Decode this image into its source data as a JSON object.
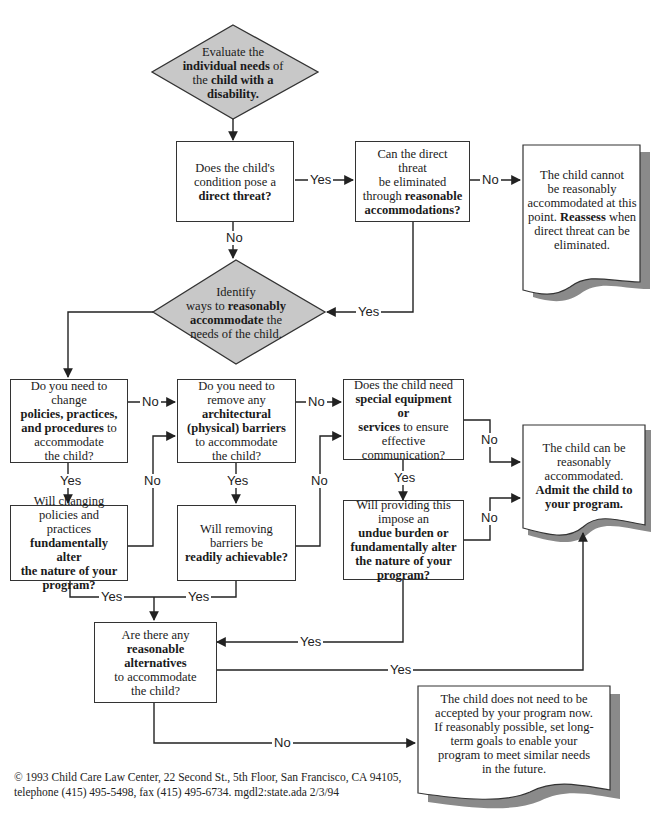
{
  "diagram": {
    "type": "flowchart",
    "colors": {
      "decision_fill": "#c8c8c8",
      "line": "#222222",
      "shadow": "#8a8a8a",
      "background": "#ffffff"
    }
  },
  "nodes": {
    "evaluate": {
      "shape": "diamond",
      "t1": "Evaluate the",
      "b1": "individual needs",
      "t2": " of",
      "t3": "the ",
      "b2": "child with a",
      "b3": "disability."
    },
    "direct_threat": {
      "shape": "box",
      "t1": "Does the child's",
      "t2": "condition pose a",
      "b1": "direct threat?"
    },
    "eliminate_threat": {
      "shape": "box",
      "t1": "Can the direct threat",
      "t2": "be eliminated",
      "t3": "through ",
      "b1": "reasonable",
      "b2": "accommodations?"
    },
    "cannot_accommodate": {
      "shape": "document",
      "t1": "The child cannot",
      "t2": "be reasonably",
      "t3": "accommodated at this",
      "t4": "point. ",
      "b1": "Reassess",
      "t5": " when",
      "t6": "direct threat can be",
      "t7": "eliminated."
    },
    "identify_ways": {
      "shape": "diamond",
      "t1": "Identify",
      "t2": "ways to ",
      "b1": "reasonably",
      "b2": "accommodate",
      "t3": " the",
      "t4": "needs of the child."
    },
    "change_policies": {
      "shape": "box",
      "t1": "Do you need to change",
      "b1": "policies, practices,",
      "b2": "and procedures",
      "t2": " to",
      "t3": "accommodate",
      "t4": "the child?"
    },
    "remove_barriers": {
      "shape": "box",
      "t1": "Do you need to",
      "t2": "remove any",
      "b1": "architectural",
      "b2": "(physical) barriers",
      "t3": "to accommodate",
      "t4": "the child?"
    },
    "special_equipment": {
      "shape": "box",
      "t1": "Does the child need",
      "b1": "special equipment or",
      "b2": "services",
      "t2": " to ensure",
      "t3": "effective",
      "t4": "communication?"
    },
    "alter_nature_policies": {
      "shape": "box",
      "t1": "Will changing",
      "t2": "policies and practices",
      "b1": "fundamentally alter",
      "b2": "the nature of your",
      "b3": "program?"
    },
    "barriers_achievable": {
      "shape": "box",
      "t1": "Will removing",
      "t2": "barriers be",
      "b1": "readily achievable?"
    },
    "undue_burden": {
      "shape": "box",
      "t1": "Will providing this",
      "t2": "impose an",
      "b1": "undue burden or",
      "b2": "fundamentally alter",
      "b3": "the nature of your",
      "b4": "program?"
    },
    "can_accommodate": {
      "shape": "document",
      "t1": "The child can be",
      "t2": "reasonably",
      "t3": "accommodated.",
      "b1": "Admit the child to",
      "b2": "your program."
    },
    "alternatives": {
      "shape": "box",
      "t1": "Are there any",
      "b1": "reasonable",
      "b2": "alternatives",
      "t2": "to accommodate",
      "t3": "the child?"
    },
    "not_accepted": {
      "shape": "document",
      "t1": "The child does not need to be",
      "t2": "accepted by your program now.",
      "t3": "If reasonably possible, set long-",
      "t4": "term goals to enable your",
      "t5": "program to meet similar needs",
      "t6": "in the future."
    }
  },
  "edges": [
    {
      "from": "evaluate",
      "to": "direct_threat",
      "label": ""
    },
    {
      "from": "direct_threat",
      "to": "eliminate_threat",
      "label": "Yes"
    },
    {
      "from": "direct_threat",
      "to": "identify_ways",
      "label": "No"
    },
    {
      "from": "eliminate_threat",
      "to": "cannot_accommodate",
      "label": "No"
    },
    {
      "from": "eliminate_threat",
      "to": "identify_ways",
      "label": "Yes"
    },
    {
      "from": "identify_ways",
      "to": "change_policies",
      "label": ""
    },
    {
      "from": "change_policies",
      "to": "remove_barriers",
      "label": "No"
    },
    {
      "from": "change_policies",
      "to": "alter_nature_policies",
      "label": "Yes"
    },
    {
      "from": "alter_nature_policies",
      "to": "remove_barriers",
      "label": "No"
    },
    {
      "from": "alter_nature_policies",
      "to": "alternatives",
      "label": "Yes"
    },
    {
      "from": "remove_barriers",
      "to": "special_equipment",
      "label": "No"
    },
    {
      "from": "remove_barriers",
      "to": "barriers_achievable",
      "label": "Yes"
    },
    {
      "from": "barriers_achievable",
      "to": "special_equipment",
      "label": "No"
    },
    {
      "from": "barriers_achievable",
      "to": "alternatives",
      "label": "Yes"
    },
    {
      "from": "special_equipment",
      "to": "can_accommodate",
      "label": "No"
    },
    {
      "from": "special_equipment",
      "to": "undue_burden",
      "label": "Yes"
    },
    {
      "from": "undue_burden",
      "to": "can_accommodate",
      "label": "No"
    },
    {
      "from": "undue_burden",
      "to": "alternatives",
      "label": "Yes"
    },
    {
      "from": "alternatives",
      "to": "can_accommodate",
      "label": "Yes"
    },
    {
      "from": "alternatives",
      "to": "not_accepted",
      "label": "No"
    }
  ],
  "labels": {
    "yes": "Yes",
    "no": "No"
  },
  "footer": {
    "line1": "© 1993 Child Care Law Center, 22 Second St., 5th Floor, San Francisco, CA 94105,",
    "line2": "telephone (415) 495-5498, fax (415) 495-6734. mgdl2:state.ada 2/3/94"
  }
}
